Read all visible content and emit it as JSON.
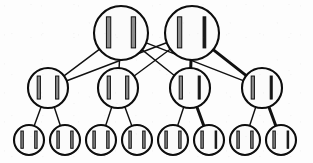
{
  "figure": {
    "background_color": "#fdfdfd",
    "stroke_color": "#111111",
    "node_fill_color": "#fbfbfb",
    "bar_fill_color": "#8c8c8c",
    "bar_bold_fill_color": "#1a1a1a"
  },
  "chart_data": {
    "type": "diagram",
    "layout": "layered-tree",
    "layers": [
      {
        "name": "root",
        "count": 2,
        "y": 33,
        "radius": 27
      },
      {
        "name": "intermediate",
        "count": 4,
        "y": 88,
        "radius": 20
      },
      {
        "name": "leaf",
        "count": 8,
        "y": 140,
        "radius": 15
      }
    ],
    "nodes": [
      {
        "id": "r1",
        "layer": "root",
        "label": "||",
        "cx": 121,
        "cy": 33,
        "r": 27,
        "bars": 2,
        "bold_bar": null
      },
      {
        "id": "r2",
        "layer": "root",
        "label": "||",
        "cx": 192,
        "cy": 33,
        "r": 27,
        "bars": 2,
        "bold_bar": "right"
      },
      {
        "id": "m1",
        "layer": "intermediate",
        "label": "||",
        "cx": 48,
        "cy": 88,
        "r": 20,
        "bars": 2,
        "bold_bar": null
      },
      {
        "id": "m2",
        "layer": "intermediate",
        "label": "||",
        "cx": 118,
        "cy": 88,
        "r": 20,
        "bars": 2,
        "bold_bar": null
      },
      {
        "id": "m3",
        "layer": "intermediate",
        "label": "||",
        "cx": 190,
        "cy": 88,
        "r": 20,
        "bars": 2,
        "bold_bar": "right"
      },
      {
        "id": "m4",
        "layer": "intermediate",
        "label": "||",
        "cx": 262,
        "cy": 88,
        "r": 20,
        "bars": 2,
        "bold_bar": "right"
      },
      {
        "id": "l1",
        "layer": "leaf",
        "label": "||",
        "cx": 29,
        "cy": 140,
        "r": 15,
        "bars": 2,
        "bold_bar": null
      },
      {
        "id": "l2",
        "layer": "leaf",
        "label": "||",
        "cx": 65,
        "cy": 140,
        "r": 15,
        "bars": 2,
        "bold_bar": null
      },
      {
        "id": "l3",
        "layer": "leaf",
        "label": "||",
        "cx": 101,
        "cy": 140,
        "r": 15,
        "bars": 2,
        "bold_bar": null
      },
      {
        "id": "l4",
        "layer": "leaf",
        "label": "||",
        "cx": 137,
        "cy": 140,
        "r": 15,
        "bars": 2,
        "bold_bar": null
      },
      {
        "id": "l5",
        "layer": "leaf",
        "label": "||",
        "cx": 173,
        "cy": 140,
        "r": 15,
        "bars": 2,
        "bold_bar": null
      },
      {
        "id": "l6",
        "layer": "leaf",
        "label": "||",
        "cx": 209,
        "cy": 140,
        "r": 15,
        "bars": 2,
        "bold_bar": "right"
      },
      {
        "id": "l7",
        "layer": "leaf",
        "label": "||",
        "cx": 245,
        "cy": 140,
        "r": 15,
        "bars": 2,
        "bold_bar": null
      },
      {
        "id": "l8",
        "layer": "leaf",
        "label": "||",
        "cx": 281,
        "cy": 140,
        "r": 15,
        "bars": 2,
        "bold_bar": "right"
      }
    ],
    "edges": [
      {
        "from": "r1",
        "to": "m1",
        "weight": "normal"
      },
      {
        "from": "r1",
        "to": "m2",
        "weight": "normal"
      },
      {
        "from": "r1",
        "to": "m3",
        "weight": "normal"
      },
      {
        "from": "r1",
        "to": "m4",
        "weight": "normal"
      },
      {
        "from": "r2",
        "to": "m1",
        "weight": "normal"
      },
      {
        "from": "r2",
        "to": "m2",
        "weight": "normal"
      },
      {
        "from": "r2",
        "to": "m3",
        "weight": "bold"
      },
      {
        "from": "r2",
        "to": "m4",
        "weight": "bold"
      },
      {
        "from": "m1",
        "to": "l1",
        "weight": "normal"
      },
      {
        "from": "m1",
        "to": "l2",
        "weight": "normal"
      },
      {
        "from": "m2",
        "to": "l3",
        "weight": "normal"
      },
      {
        "from": "m2",
        "to": "l4",
        "weight": "normal"
      },
      {
        "from": "m3",
        "to": "l5",
        "weight": "normal"
      },
      {
        "from": "m3",
        "to": "l6",
        "weight": "bold"
      },
      {
        "from": "m4",
        "to": "l7",
        "weight": "normal"
      },
      {
        "from": "m4",
        "to": "l8",
        "weight": "bold"
      }
    ],
    "counts": {
      "nodes": 14,
      "edges": 16,
      "roots": 2,
      "intermediate": 4,
      "leaves": 8
    }
  }
}
